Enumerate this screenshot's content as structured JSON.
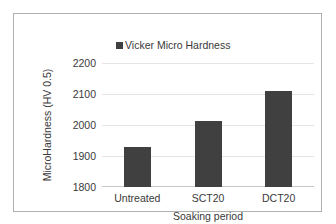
{
  "chart_data": {
    "type": "bar",
    "title": "",
    "categories": [
      "Untreated",
      "SCT20",
      "DCT20"
    ],
    "values": [
      1929,
      2013,
      2110
    ],
    "series": [
      {
        "name": "Vicker Micro Hardness",
        "values": [
          1929,
          2013,
          2110
        ]
      }
    ],
    "xlabel": "Soaking period",
    "ylabel": "MicroHardness (HV 0.5)",
    "ylim": [
      1800,
      2200
    ],
    "yticks": [
      "2200",
      "2100",
      "2000",
      "1900",
      "1800"
    ],
    "ytick_values": [
      2200,
      2100,
      2000,
      1900,
      1800
    ],
    "grid": "horizontal",
    "legend": {
      "position": "top-center",
      "entries": [
        "Vicker Micro Hardness"
      ]
    },
    "colors": {
      "bar": "#404040",
      "gridline": "#e4e4e4",
      "axis": "#c8c8c8",
      "text": "#3a3a3a",
      "frame": "#b0b0b0",
      "background": "#ffffff"
    }
  }
}
